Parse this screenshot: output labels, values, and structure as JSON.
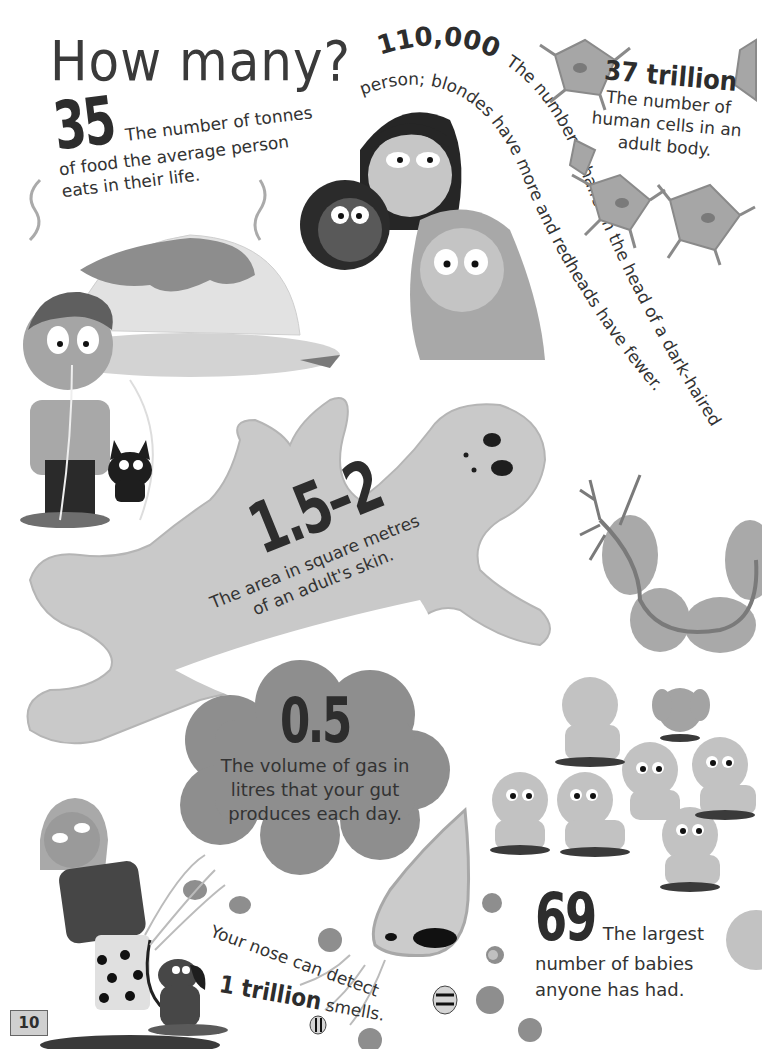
{
  "page": {
    "title": "How many?",
    "page_number": "10"
  },
  "facts": {
    "food": {
      "number": "35",
      "text_line1": "The number of tonnes",
      "text_line2": "of food the average person",
      "text_line3": "eats in their life."
    },
    "hair": {
      "number": "110,000",
      "text_arc1": "The number of hairs on the head of a dark-haired",
      "text_arc2": "person; blondes have more and redheads have fewer."
    },
    "cells": {
      "number": "37 trillion",
      "text_line1": "The number of",
      "text_line2": "human cells in an",
      "text_line3": "adult body."
    },
    "skin": {
      "number": "1.5–2",
      "text_line1": "The area in square metres",
      "text_line2": "of an adult's skin."
    },
    "gas": {
      "number": "0.5",
      "text_line1": "The volume of gas in",
      "text_line2": "litres that your gut",
      "text_line3": "produces each day."
    },
    "smell": {
      "text_line1": "Your nose can detect",
      "number": "1 trillion",
      "text_suffix": "smells."
    },
    "babies": {
      "number": "69",
      "text_line1": "The largest",
      "text_line2": "number of babies",
      "text_line3": "anyone has had."
    }
  },
  "illustrations": [
    "spaghetti-plate",
    "boy-eating-spaghetti",
    "black-cat",
    "three-girls-heads",
    "neuron-cells",
    "skin-figure",
    "gas-cloud",
    "nerve-cell",
    "babies-group",
    "girl-with-dog",
    "dog",
    "nose",
    "flowers",
    "bees"
  ],
  "colors": {
    "ink": "#2d2d2d",
    "light_gray": "#c8c8c8",
    "mid_gray": "#9a9a9a",
    "cloud_gray": "#8e8e8e",
    "skin_gray": "#bdbdbd"
  }
}
